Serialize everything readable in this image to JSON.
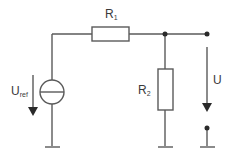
{
  "diagram": {
    "colors": {
      "wire": "#5a5a5a",
      "fill": "#ffffff",
      "text": "#3a3a3a"
    },
    "labels": {
      "r1": {
        "main": "R",
        "sub": "1"
      },
      "r2": {
        "main": "R",
        "sub": "2"
      },
      "uref": {
        "main": "U",
        "sub": "ref"
      },
      "u": {
        "main": "U",
        "sub": ""
      }
    },
    "components": [
      {
        "id": "R1",
        "type": "resistor",
        "orientation": "horizontal"
      },
      {
        "id": "R2",
        "type": "resistor",
        "orientation": "vertical"
      },
      {
        "id": "Uref",
        "type": "voltage-source"
      },
      {
        "id": "U",
        "type": "output-voltage"
      }
    ]
  }
}
